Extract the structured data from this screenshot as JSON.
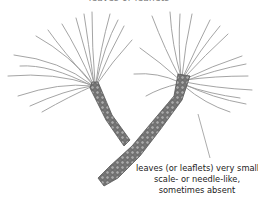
{
  "figure": {
    "top_caption": "leaves or leaflets",
    "annotation": {
      "lines": [
        "leaves (or leaflets) very small,",
        "scale- or needle-like,",
        "sometimes absent"
      ]
    },
    "colors": {
      "needle": "#9a9a9a",
      "stem_fill": "#7d7d7d",
      "stem_cell": "#bdbdbd",
      "leader_line": "#888888",
      "text": "#222222"
    }
  }
}
